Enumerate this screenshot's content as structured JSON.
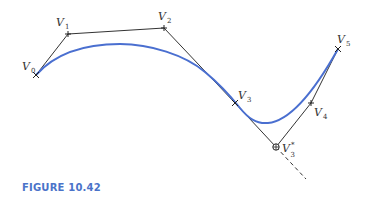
{
  "figure": {
    "caption": "FIGURE 10.42",
    "colors": {
      "curve": "#4a6fd0",
      "polygon": "#333333",
      "caption": "#4a73c9"
    },
    "points": [
      {
        "name": "V",
        "sub": "0",
        "sup": "",
        "x": 36,
        "y": 75
      },
      {
        "name": "V",
        "sub": "1",
        "sup": "",
        "x": 68,
        "y": 34
      },
      {
        "name": "V",
        "sub": "2",
        "sup": "",
        "x": 164,
        "y": 28
      },
      {
        "name": "V",
        "sub": "3",
        "sup": "",
        "x": 235,
        "y": 103
      },
      {
        "name": "V",
        "sub": "3",
        "sup": "*",
        "x": 276,
        "y": 147
      },
      {
        "name": "V",
        "sub": "4",
        "sup": "",
        "x": 311,
        "y": 103
      },
      {
        "name": "V",
        "sub": "5",
        "sup": "",
        "x": 338,
        "y": 49
      }
    ],
    "labels": {
      "v0": {
        "main": "V",
        "sub": "0"
      },
      "v1": {
        "main": "V",
        "sub": "1"
      },
      "v2": {
        "main": "V",
        "sub": "2"
      },
      "v3": {
        "main": "V",
        "sub": "3"
      },
      "v3star": {
        "main": "V",
        "sup": "*",
        "sub": "3"
      },
      "v4": {
        "main": "V",
        "sub": "4"
      },
      "v5": {
        "main": "V",
        "sub": "5"
      }
    }
  }
}
